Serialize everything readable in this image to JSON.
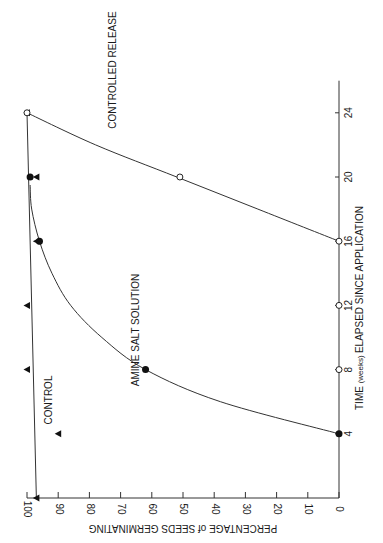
{
  "chart_data": {
    "type": "line",
    "orientation": "rotated-90",
    "title": "",
    "xlabel_main": "TIME",
    "xlabel_unit": "(weeks)",
    "xlabel_rest": "ELAPSED SINCE APPLICATION",
    "ylabel": "PERCENTAGE of SEEDS GERMINATING",
    "x_ticks": [
      "4",
      "8",
      "12",
      "16",
      "20",
      "24"
    ],
    "y_ticks": [
      "100",
      "90",
      "80",
      "70",
      "60",
      "50",
      "40",
      "30",
      "20",
      "10",
      "0"
    ],
    "xlim": [
      0,
      26
    ],
    "ylim": [
      0,
      100
    ],
    "grid": false,
    "series": [
      {
        "name": "CONTROL",
        "marker": "filled-triangle",
        "line": [
          [
            0,
            97
          ],
          [
            24,
            100
          ]
        ],
        "points": [
          [
            0,
            97
          ],
          [
            4,
            90
          ],
          [
            8,
            100
          ],
          [
            12,
            100
          ],
          [
            16,
            97
          ],
          [
            20,
            97
          ],
          [
            24,
            100
          ]
        ]
      },
      {
        "name": "AMINE SALT SOLUTION",
        "marker": "filled-circle",
        "line": [
          [
            4,
            0
          ],
          [
            6,
            38
          ],
          [
            8,
            62
          ],
          [
            10,
            76
          ],
          [
            12,
            86
          ],
          [
            14,
            92
          ],
          [
            16,
            96
          ],
          [
            18,
            98.5
          ],
          [
            19.5,
            99
          ]
        ],
        "points": [
          [
            4,
            0
          ],
          [
            8,
            62
          ],
          [
            16,
            96
          ],
          [
            20,
            99
          ]
        ]
      },
      {
        "name": "CONTROLLED RELEASE",
        "marker": "open-circle",
        "line": [
          [
            16,
            0
          ],
          [
            18,
            26
          ],
          [
            20,
            52
          ],
          [
            22,
            78
          ],
          [
            24,
            100
          ]
        ],
        "points": [
          [
            8,
            0
          ],
          [
            12,
            0
          ],
          [
            16,
            0
          ],
          [
            20,
            51
          ],
          [
            24,
            100
          ]
        ]
      }
    ]
  },
  "labels": {
    "control": "CONTROL",
    "amine": "AMINE SALT SOLUTION",
    "controlled": "CONTROLLED RELEASE"
  }
}
